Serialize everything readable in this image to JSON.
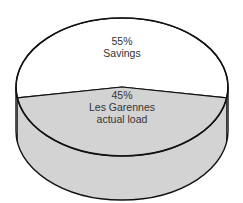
{
  "chart_data": {
    "type": "pie",
    "style": "3d-cylinder",
    "title": "",
    "slices": [
      {
        "name": "Savings",
        "value": 55,
        "label_pct": "55%",
        "label_text": [
          "Savings"
        ],
        "color": "#ffffff"
      },
      {
        "name": "Les Garennes actual load",
        "value": 45,
        "label_pct": "45%",
        "label_text": [
          "Les Garennes",
          "actual load"
        ],
        "color": "#d3d3d3"
      }
    ],
    "outline_color": "#111111",
    "legend": "none"
  }
}
